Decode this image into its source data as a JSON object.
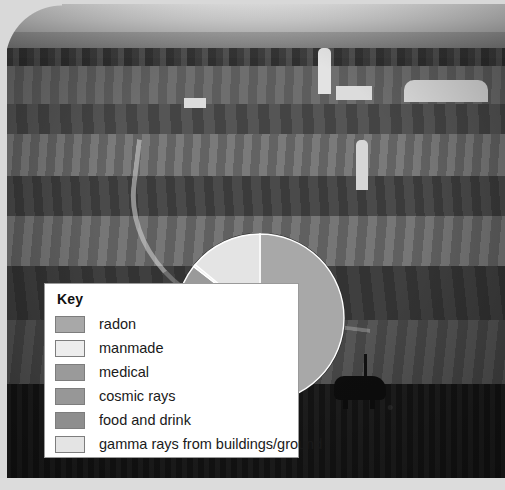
{
  "image": {
    "caption": "Grayscale photograph of rolling farmland with barns, silos and a cow, overlaid with a pie chart and key"
  },
  "legend": {
    "title": "Key",
    "items": [
      {
        "label": "radon",
        "color": "#a8a8a8"
      },
      {
        "label": "manmade",
        "color": "#ededed"
      },
      {
        "label": "medical",
        "color": "#9a9a9a"
      },
      {
        "label": "cosmic rays",
        "color": "#979797"
      },
      {
        "label": "food and drink",
        "color": "#8e8e8e"
      },
      {
        "label": "gamma rays from buildings/ground",
        "color": "#e4e4e4"
      }
    ]
  },
  "chart_data": {
    "type": "pie",
    "legend_position": "left",
    "start_angle_deg": 0,
    "direction": "clockwise",
    "labels": [
      "radon",
      "food and drink",
      "cosmic rays",
      "medical",
      "manmade",
      "gamma rays from buildings/ground"
    ],
    "values": [
      50,
      11.5,
      10,
      14,
      0.5,
      14
    ],
    "unit": "%",
    "colors": [
      "#a8a8a8",
      "#8e8e8e",
      "#979797",
      "#9a9a9a",
      "#ededed",
      "#e4e4e4"
    ],
    "slices": [
      {
        "label": "radon",
        "value": 50,
        "color": "#a8a8a8"
      },
      {
        "label": "food and drink",
        "value": 11.5,
        "color": "#8e8e8e"
      },
      {
        "label": "cosmic rays",
        "value": 10,
        "color": "#979797"
      },
      {
        "label": "medical",
        "value": 14,
        "color": "#9a9a9a"
      },
      {
        "label": "manmade",
        "value": 0.5,
        "color": "#ededed"
      },
      {
        "label": "gamma rays from buildings/ground",
        "value": 14,
        "color": "#e4e4e4"
      }
    ],
    "geometry": {
      "cx": 85,
      "cy": 85,
      "r": 84
    }
  }
}
